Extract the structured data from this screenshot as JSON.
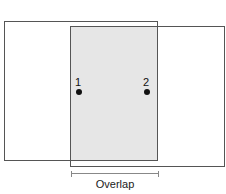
{
  "diagram": {
    "points": [
      {
        "label": "1"
      },
      {
        "label": "2"
      }
    ],
    "caption": "Overlap",
    "colors": {
      "outline": "#555555",
      "overlap_fill": "#e6e6e6",
      "dot": "#111111"
    }
  }
}
